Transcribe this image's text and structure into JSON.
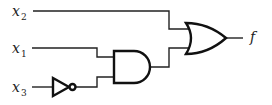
{
  "diagram": {
    "type": "logic-circuit",
    "inputs": [
      {
        "name": "x",
        "subscript": "2"
      },
      {
        "name": "x",
        "subscript": "1"
      },
      {
        "name": "x",
        "subscript": "3"
      }
    ],
    "output": {
      "name": "f"
    },
    "gates": [
      {
        "id": "not1",
        "type": "NOT",
        "input": "x3"
      },
      {
        "id": "and1",
        "type": "AND",
        "inputs": [
          "x1",
          "not1"
        ]
      },
      {
        "id": "or1",
        "type": "OR",
        "inputs": [
          "x2",
          "and1"
        ],
        "output": "f"
      }
    ],
    "expression": "f = x2 + x1·x3'"
  }
}
